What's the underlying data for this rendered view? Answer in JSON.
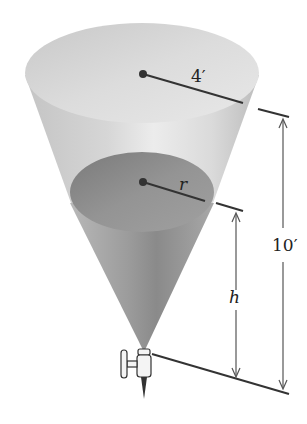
{
  "diagram": {
    "type": "conical-tank-with-valve",
    "labels": {
      "top_radius": "4′",
      "water_radius": "r",
      "water_height": "h",
      "total_height": "10′"
    },
    "colors": {
      "tank_light": "#d8d8d8",
      "tank_mid": "#b0b0b0",
      "water_surface": "#8e8e8e",
      "water_body": "#9a9a9a",
      "line": "#333333"
    }
  }
}
